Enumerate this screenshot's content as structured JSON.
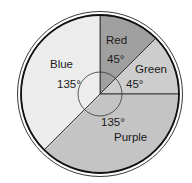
{
  "chart_data": {
    "type": "pie",
    "title": "",
    "unit": "degrees",
    "categories": [
      "Red",
      "Green",
      "Purple",
      "Blue"
    ],
    "values": [
      45,
      45,
      135,
      135
    ],
    "value_labels": [
      "45°",
      "45°",
      "135°",
      "135°"
    ],
    "colors": [
      "#a0a0a0",
      "#cdcdcd",
      "#c4c4c4",
      "#ececec"
    ],
    "start_angle_deg": -90,
    "direction": "clockwise",
    "legend": "none (labels placed inside slices)",
    "geometry": {
      "cx": 100,
      "cy": 94,
      "r": 79,
      "outer_ring_r": 82.5,
      "angle_arc_r": 22
    }
  },
  "slices": [
    {
      "name": "Red",
      "label": "Red",
      "angle": "45°",
      "color": "#a0a0a0"
    },
    {
      "name": "Green",
      "label": "Green",
      "angle": "45°",
      "color": "#cdcdcd"
    },
    {
      "name": "Purple",
      "label": "Purple",
      "angle": "135°",
      "color": "#c4c4c4"
    },
    {
      "name": "Blue",
      "label": "Blue",
      "angle": "135°",
      "color": "#ececec"
    }
  ]
}
